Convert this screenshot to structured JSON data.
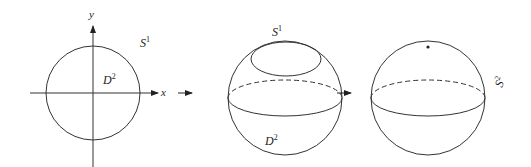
{
  "diagram": {
    "stroke_color": "#333333",
    "panels": [
      {
        "id": "disk",
        "labels": {
          "y_axis": "y",
          "x_axis": "x",
          "circle": "S",
          "circle_sup": "1",
          "disk": "D",
          "disk_sup": "2"
        }
      },
      {
        "id": "disk-on-sphere",
        "labels": {
          "boundary": "S",
          "boundary_sup": "1",
          "disk": "D",
          "disk_sup": "2"
        }
      },
      {
        "id": "sphere",
        "labels": {
          "sphere": "S",
          "sphere_sup": "2"
        },
        "marked_point": "collapsed boundary point"
      }
    ],
    "arrows": [
      "→",
      "→"
    ]
  }
}
